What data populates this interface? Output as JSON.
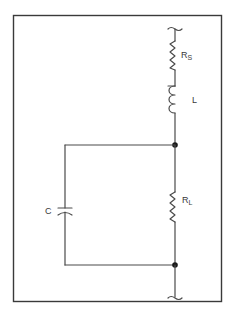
{
  "diagram": {
    "type": "circuit-schematic",
    "components": {
      "source_resistor": {
        "label": "R",
        "subscript": "S"
      },
      "inductor": {
        "label": "L"
      },
      "capacitor": {
        "label": "C"
      },
      "load_resistor": {
        "label": "R",
        "subscript": "L"
      }
    },
    "nodes": [
      "junction-top",
      "junction-bottom"
    ],
    "colors": {
      "line": "#4a4a4a",
      "frame": "#3a3a3a",
      "background": "#ffffff"
    }
  }
}
